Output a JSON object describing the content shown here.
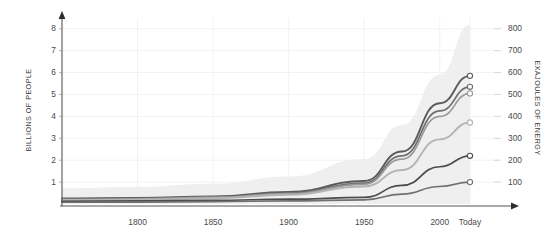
{
  "chart_data": {
    "type": "line",
    "title": "",
    "subtitle": "",
    "xlabel": "",
    "ylabel": "BILLIONS OF PEOPLE",
    "ylabel_right": "EXAJOULES OF ENERGY",
    "x": [
      1750,
      1800,
      1850,
      1900,
      1950,
      1975,
      2000,
      2020
    ],
    "xlim": [
      1750,
      2020
    ],
    "ylim": [
      0,
      8.4
    ],
    "ylim_right": [
      0,
      840
    ],
    "xtick_labels": [
      "1800",
      "1850",
      "1900",
      "1950",
      "2000",
      "Today"
    ],
    "xtick_values": [
      1800,
      1850,
      1900,
      1950,
      2000,
      2020
    ],
    "ytick_labels_left": [
      "1",
      "2",
      "3",
      "4",
      "5",
      "6",
      "7",
      "8"
    ],
    "ytick_values_left": [
      1,
      2,
      3,
      4,
      5,
      6,
      7,
      8
    ],
    "ytick_labels_right": [
      "100",
      "200",
      "300",
      "400",
      "500",
      "600",
      "700",
      "800"
    ],
    "ytick_values_right": [
      100,
      200,
      300,
      400,
      500,
      600,
      700,
      800
    ],
    "grid": true,
    "legend": "none",
    "band": {
      "name": "total-range-band",
      "color": "#eeeeee",
      "upper": [
        0.72,
        0.78,
        0.92,
        1.25,
        2.05,
        3.6,
        5.9,
        8.2
      ],
      "lower": [
        0.0,
        0.0,
        0.0,
        0.0,
        0.0,
        0.0,
        0.0,
        0.0
      ]
    },
    "series": [
      {
        "name": "series-1",
        "color": "#5a5a5a",
        "width": 1.9,
        "marker": "open-circle",
        "values": [
          0.25,
          0.28,
          0.35,
          0.55,
          1.05,
          2.4,
          4.6,
          5.85
        ]
      },
      {
        "name": "series-2",
        "color": "#6e6e6e",
        "width": 1.7,
        "marker": "open-circle",
        "values": [
          0.22,
          0.25,
          0.32,
          0.5,
          0.95,
          2.2,
          4.25,
          5.35
        ]
      },
      {
        "name": "series-3",
        "color": "#9a9a9a",
        "width": 1.7,
        "marker": "open-circle",
        "values": [
          0.2,
          0.23,
          0.3,
          0.47,
          0.9,
          2.05,
          4.0,
          5.05
        ]
      },
      {
        "name": "series-4",
        "color": "#b4b4b4",
        "width": 1.9,
        "marker": "open-circle",
        "values": [
          0.18,
          0.2,
          0.26,
          0.42,
          0.8,
          1.55,
          2.95,
          3.72
        ]
      },
      {
        "name": "series-5",
        "color": "#4c4c4c",
        "width": 1.7,
        "marker": "open-circle",
        "values": [
          0.12,
          0.14,
          0.17,
          0.22,
          0.3,
          0.85,
          1.7,
          2.2
        ]
      },
      {
        "name": "series-6",
        "color": "#707070",
        "width": 1.7,
        "marker": "open-circle",
        "values": [
          0.08,
          0.09,
          0.11,
          0.14,
          0.19,
          0.45,
          0.8,
          1.0
        ]
      }
    ]
  },
  "axes": {
    "left_title": "BILLIONS OF PEOPLE",
    "right_title": "EXAJOULES OF ENERGY",
    "left_ticks": [
      "8",
      "7",
      "6",
      "5",
      "4",
      "3",
      "2",
      "1"
    ],
    "right_ticks": [
      "800",
      "700",
      "600",
      "500",
      "400",
      "300",
      "200",
      "100"
    ],
    "x_ticks": [
      "1800",
      "1850",
      "1900",
      "1950",
      "2000",
      "Today"
    ]
  },
  "colors": {
    "grid": "#f2f2f2",
    "axis": "#555555",
    "band": "#ededed",
    "text": "#444444",
    "background": "#ffffff"
  }
}
